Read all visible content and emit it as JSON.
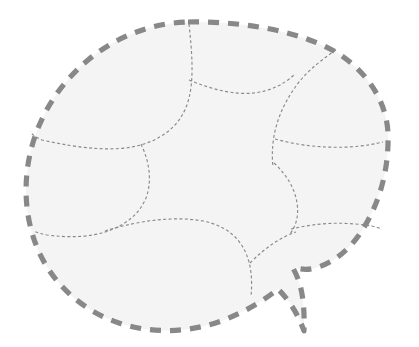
{
  "figure": {
    "kind": "topological-region-diagram",
    "title": "",
    "canvas": {
      "width": 419,
      "height": 347,
      "background": "#ffffff"
    },
    "colors": {
      "background": "#ffffff",
      "region_fill": "#f4f4f4",
      "outer_boundary_stroke": "#888888",
      "inner_curve_stroke": "#8a8a8a"
    },
    "outer_boundary": {
      "name": "outer-boundary",
      "stroke_width": 5.2,
      "dash_pattern": "11 9",
      "linecap": "butt",
      "closed": true,
      "has_notch": true,
      "notch_description": "narrow downward spike on the lower-right of the boundary",
      "extents": {
        "left": 26,
        "right": 389,
        "top": 21,
        "bottom": 332
      },
      "path": "M 188 22 C 246 21 300 32 334 51 C 365 69 387 100 388 134 C 389 171 379 206 359 235 C 347 252 331 264 315 268 C 304 271 299 268 293 268 C 300 281 305 296 304 331 C 298 314 289 300 278 289 C 266 299 247 311 224 320 C 190 333 152 334 119 323 C 83 311 54 285 39 252 C 25 221 23 186 30 154 C 38 118 58 85 88 60 C 117 36 152 23 188 22 Z"
    },
    "inner_curves": [
      {
        "name": "inner-curve-top-left-arc",
        "stroke_width": 1.15,
        "dash_pattern": "3 2.4",
        "path": "M 189 24 C 192 52 194 78 189 98 C 183 122 167 137 141 145 C 115 152 82 149 42 140 C 37 138 33 135 30 132"
      },
      {
        "name": "inner-curve-top-right-arc",
        "stroke_width": 1.15,
        "dash_pattern": "3 2.4",
        "path": "M 336 50 C 318 62 303 75 294 89 C 283 105 277 120 274 136 C 272 148 272 158 273 167"
      },
      {
        "name": "inner-curve-top-center-link",
        "stroke_width": 1.15,
        "dash_pattern": "3 2.4",
        "path": "M 189 80 C 213 90 235 95 254 93 C 271 91 284 84 294 75"
      },
      {
        "name": "inner-curve-left-lobe",
        "stroke_width": 1.15,
        "dash_pattern": "3 2.4",
        "path": "M 141 144 C 150 163 152 182 146 198 C 139 215 124 226 105 232 C 89 237 70 238 47 235 C 42 234 38 233 34 231"
      },
      {
        "name": "inner-curve-right-upper-link",
        "stroke_width": 1.15,
        "dash_pattern": "3 2.4",
        "path": "M 275 139 C 300 146 325 148 349 147 C 364 146 375 144 383 142"
      },
      {
        "name": "inner-curve-right-lower-lobe",
        "stroke_width": 1.15,
        "dash_pattern": "3 2.4",
        "path": "M 274 163 C 287 175 295 189 297 203 C 299 216 296 226 290 234"
      },
      {
        "name": "inner-curve-right-lower-link",
        "stroke_width": 1.15,
        "dash_pattern": "3 2.4",
        "path": "M 291 229 C 312 224 334 222 355 224 C 369 225 377 227 382 229"
      },
      {
        "name": "inner-curve-bottom-center-arc",
        "stroke_width": 1.15,
        "dash_pattern": "3 2.4",
        "path": "M 105 231 C 140 220 175 216 203 221 C 228 226 243 240 249 262 C 252 274 252 286 251 296"
      },
      {
        "name": "inner-curve-bottom-right-arc",
        "stroke_width": 1.15,
        "dash_pattern": "3 2.4",
        "path": "M 250 263 C 266 247 281 237 296 232"
      }
    ],
    "junction_points": [
      {
        "name": "junction-top-center",
        "x": 189,
        "y": 80
      },
      {
        "name": "junction-left-mid",
        "x": 141,
        "y": 144
      },
      {
        "name": "junction-right-upper",
        "x": 275,
        "y": 139
      },
      {
        "name": "junction-left-lower",
        "x": 105,
        "y": 231
      },
      {
        "name": "junction-bottom-center",
        "x": 249,
        "y": 262
      },
      {
        "name": "junction-right-lower",
        "x": 293,
        "y": 232
      }
    ]
  }
}
